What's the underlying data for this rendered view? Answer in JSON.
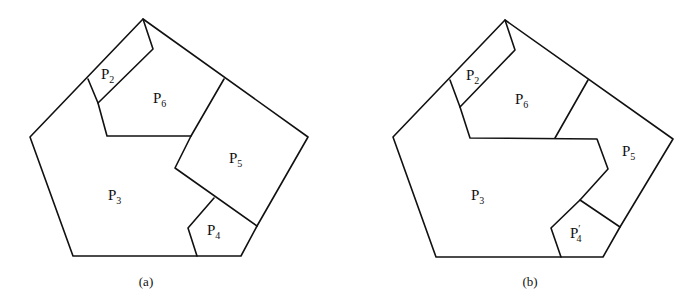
{
  "figure_a": {
    "caption": "(a)",
    "regions": [
      {
        "id": "P2",
        "letter": "P",
        "sub": "2",
        "prime": ""
      },
      {
        "id": "P6",
        "letter": "P",
        "sub": "6",
        "prime": ""
      },
      {
        "id": "P5",
        "letter": "P",
        "sub": "5",
        "prime": ""
      },
      {
        "id": "P3",
        "letter": "P",
        "sub": "3",
        "prime": ""
      },
      {
        "id": "P4",
        "letter": "P",
        "sub": "4",
        "prime": ""
      }
    ]
  },
  "figure_b": {
    "caption": "(b)",
    "regions": [
      {
        "id": "P2",
        "letter": "P",
        "sub": "2",
        "prime": ""
      },
      {
        "id": "P6",
        "letter": "P",
        "sub": "6",
        "prime": ""
      },
      {
        "id": "P5",
        "letter": "P",
        "sub": "5",
        "prime": ""
      },
      {
        "id": "P3",
        "letter": "P",
        "sub": "3",
        "prime": ""
      },
      {
        "id": "P4prime",
        "letter": "P",
        "sub": "4",
        "prime": "′"
      }
    ]
  },
  "colors": {
    "stroke": "#111111",
    "background": "#ffffff"
  }
}
